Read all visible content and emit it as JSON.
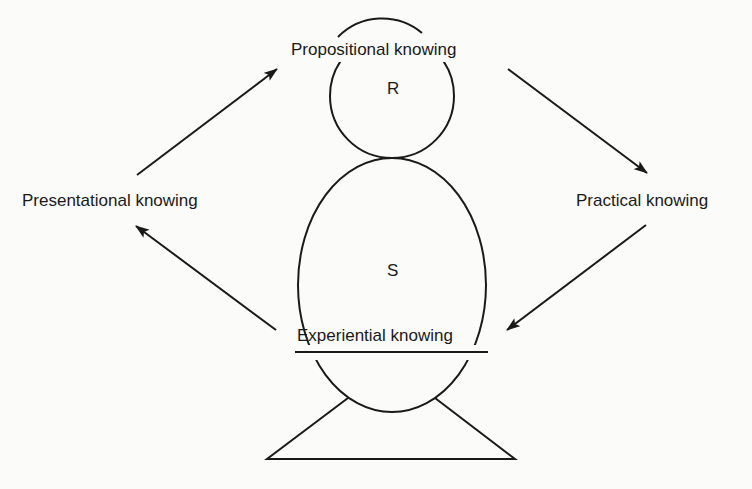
{
  "diagram": {
    "nodes": {
      "propositional": "Propositional knowing",
      "practical": "Practical knowing",
      "experiential": "Experiential knowing",
      "presentational": "Presentational knowing"
    },
    "figure_labels": {
      "head": "R",
      "body": "S"
    },
    "edges": [
      {
        "from": "Presentational knowing",
        "to": "Propositional knowing"
      },
      {
        "from": "Propositional knowing",
        "to": "Practical knowing"
      },
      {
        "from": "Practical knowing",
        "to": "Experiential knowing"
      },
      {
        "from": "Experiential knowing",
        "to": "Presentational knowing"
      }
    ],
    "colors": {
      "stroke": "#1a1a1a",
      "background": "#fbfbfa"
    }
  }
}
